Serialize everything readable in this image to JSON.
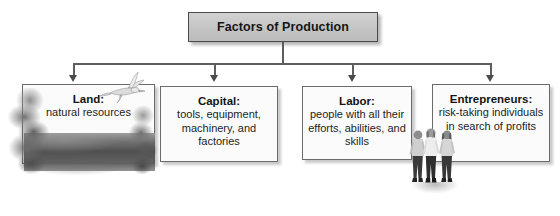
{
  "diagram": {
    "type": "hierarchy-flowchart",
    "title_box": {
      "label": "Factors of Production",
      "fill_color": "#c4c4c4",
      "border_color": "#4a4a4a"
    },
    "connector": {
      "line_color": "#5d5d5d",
      "arrow_color": "#4a4a4a",
      "branch_count": 4
    },
    "nodes": [
      {
        "name": "land",
        "heading": "Land:",
        "description": "natural resources",
        "imagery": [
          "tree-photo",
          "bird-photo",
          "landscape-photo"
        ]
      },
      {
        "name": "capital",
        "heading": "Capital:",
        "description": "tools, equipment, machinery, and factories",
        "imagery": []
      },
      {
        "name": "labor",
        "heading": "Labor:",
        "description": "people with all their efforts, abilities, and skills",
        "imagery": [
          "people-photo"
        ]
      },
      {
        "name": "entrepreneurs",
        "heading": "Entrepreneurs:",
        "description": "risk-taking individuals in search of profits",
        "imagery": [
          "people-photo"
        ]
      }
    ]
  }
}
